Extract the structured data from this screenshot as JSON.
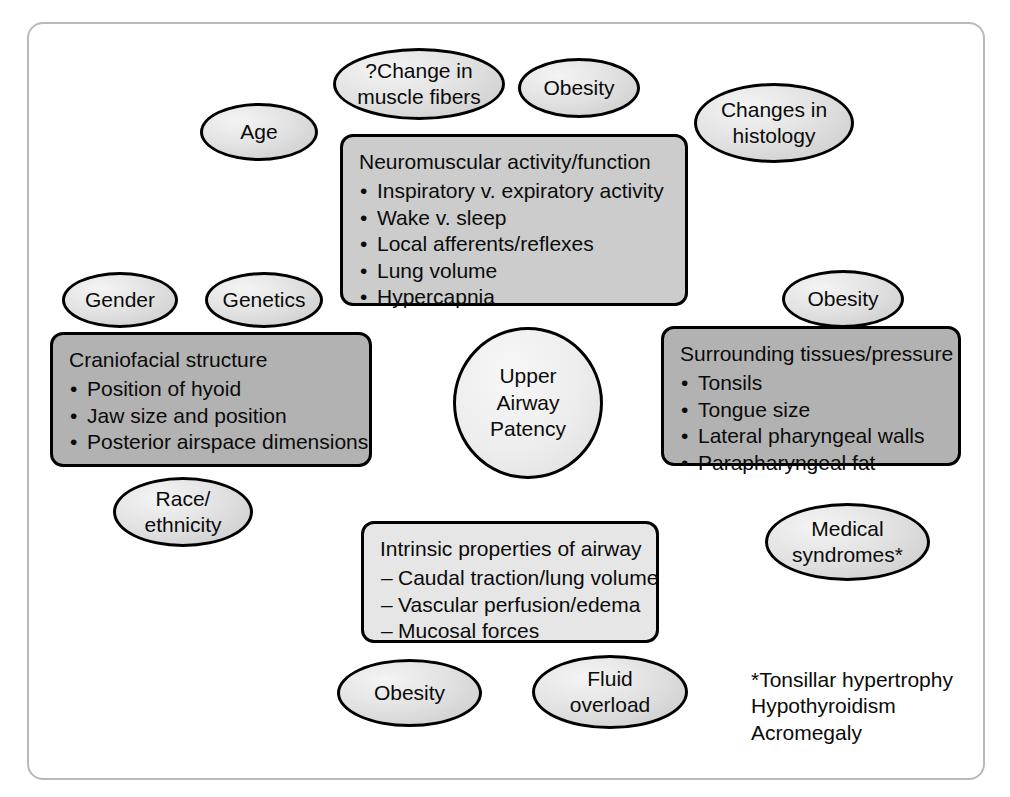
{
  "diagram": {
    "center": {
      "name": "upper-airway-patency",
      "lines": [
        "Upper",
        "Airway",
        "Patency"
      ]
    },
    "ellipses": [
      {
        "name": "change-in-muscle-fibers",
        "lines": [
          "?Change in",
          "muscle fibers"
        ]
      },
      {
        "name": "obesity-top",
        "lines": [
          "Obesity"
        ]
      },
      {
        "name": "changes-in-histology",
        "lines": [
          "Changes in",
          "histology"
        ]
      },
      {
        "name": "age",
        "lines": [
          "Age"
        ]
      },
      {
        "name": "gender",
        "lines": [
          "Gender"
        ]
      },
      {
        "name": "genetics",
        "lines": [
          "Genetics"
        ]
      },
      {
        "name": "obesity-right",
        "lines": [
          "Obesity"
        ]
      },
      {
        "name": "race-ethnicity",
        "lines": [
          "Race/",
          "ethnicity"
        ]
      },
      {
        "name": "medical-syndromes",
        "lines": [
          "Medical",
          "syndromes*"
        ]
      },
      {
        "name": "obesity-bottom",
        "lines": [
          "Obesity"
        ]
      },
      {
        "name": "fluid-overload",
        "lines": [
          "Fluid",
          "overload"
        ]
      }
    ],
    "boxes": [
      {
        "name": "neuromuscular-activity-box",
        "title": "Neuromuscular activity/function",
        "marker": "•",
        "items": [
          "Inspiratory v. expiratory activity",
          "Wake v. sleep",
          "Local afferents/reflexes",
          "Lung volume",
          "Hypercapnia"
        ]
      },
      {
        "name": "craniofacial-structure-box",
        "title": "Craniofacial structure",
        "marker": "•",
        "items": [
          "Position of hyoid",
          "Jaw size and position",
          "Posterior airspace dimensions"
        ]
      },
      {
        "name": "surrounding-tissues-box",
        "title": "Surrounding tissues/pressure",
        "marker": "•",
        "items": [
          "Tonsils",
          "Tongue size",
          "Lateral pharyngeal walls",
          "Parapharyngeal fat"
        ]
      },
      {
        "name": "intrinsic-properties-box",
        "title": "Intrinsic properties of airway",
        "marker": "–",
        "items": [
          "Caudal traction/lung volume",
          "Vascular perfusion/edema",
          "Mucosal forces"
        ]
      }
    ],
    "footnote": {
      "name": "medical-syndromes-footnote",
      "lines": [
        "*Tonsillar hypertrophy",
        "Hypothyroidism",
        "Acromegaly"
      ]
    },
    "colors": {
      "frame_border": "#b9b9b9",
      "node_border": "#000000",
      "box_dark": "#b2b2b2",
      "box_mid": "#cccccc",
      "box_light": "#e6e6e6",
      "text": "#0b0b0b",
      "background": "#ffffff"
    }
  }
}
